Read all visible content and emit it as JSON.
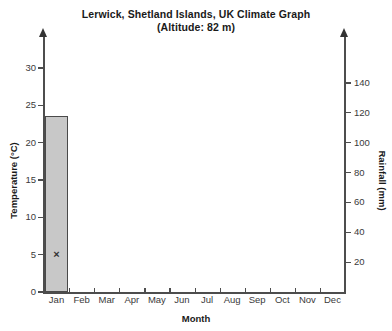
{
  "chart_data": {
    "type": "bar",
    "title": "Lerwick, Shetland Islands, UK Climate Graph",
    "subtitle": "(Altitude: 82 m)",
    "xlabel": "Month",
    "ylabel": "Temperature (°C)",
    "y2label": "Rainfall (mm)",
    "categories": [
      "Jan",
      "Feb",
      "Mar",
      "Apr",
      "May",
      "Jun",
      "Jul",
      "Aug",
      "Sep",
      "Oct",
      "Nov",
      "Dec"
    ],
    "ylim": [
      0,
      32
    ],
    "y2lim": [
      0,
      160
    ],
    "yticks": [
      0,
      5,
      10,
      15,
      20,
      25,
      30
    ],
    "y2ticks": [
      20,
      40,
      60,
      80,
      100,
      120,
      140
    ],
    "grid": false,
    "legend": "none",
    "series": [
      {
        "name": "Rainfall (mm)",
        "type": "bar",
        "axis": "right",
        "color": "#c8c8c8",
        "values": [
          118,
          null,
          null,
          null,
          null,
          null,
          null,
          null,
          null,
          null,
          null,
          null
        ]
      },
      {
        "name": "Temperature (°C)",
        "type": "scatter",
        "axis": "left",
        "marker": "x",
        "color": "#333333",
        "values": [
          5,
          null,
          null,
          null,
          null,
          null,
          null,
          null,
          null,
          null,
          null,
          null
        ]
      }
    ]
  }
}
